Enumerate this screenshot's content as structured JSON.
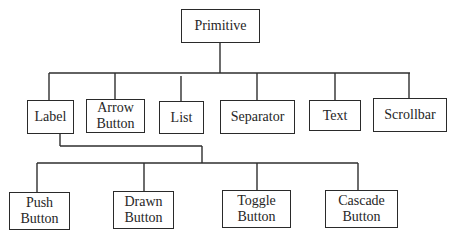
{
  "diagram": {
    "type": "class-hierarchy-tree",
    "root": {
      "id": "primitive",
      "label": "Primitive"
    },
    "level1": [
      {
        "id": "label",
        "label": "Label",
        "parent": "primitive"
      },
      {
        "id": "arrow-button",
        "label": "Arrow\nButton",
        "parent": "primitive"
      },
      {
        "id": "list",
        "label": "List",
        "parent": "primitive"
      },
      {
        "id": "separator",
        "label": "Separator",
        "parent": "primitive"
      },
      {
        "id": "text",
        "label": "Text",
        "parent": "primitive"
      },
      {
        "id": "scrollbar",
        "label": "Scrollbar",
        "parent": "primitive"
      }
    ],
    "level2": [
      {
        "id": "push-button",
        "label": "Push\nButton",
        "parent": "label"
      },
      {
        "id": "drawn-button",
        "label": "Drawn\nButton",
        "parent": "label"
      },
      {
        "id": "toggle-button",
        "label": "Toggle\nButton",
        "parent": "label"
      },
      {
        "id": "cascade-button",
        "label": "Cascade\nButton",
        "parent": "label"
      }
    ],
    "colors": {
      "line": "#2e2e2e",
      "text": "#262626",
      "background": "#ffffff"
    }
  }
}
